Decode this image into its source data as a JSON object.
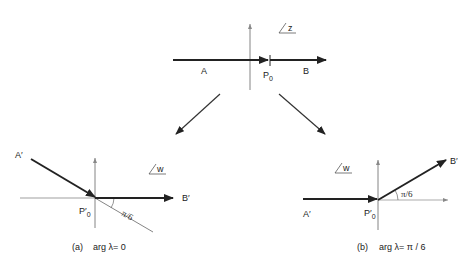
{
  "top_panel": {
    "plane_label": "z",
    "point_a": "A",
    "point_b": "B",
    "point_p": "P",
    "point_p_sub": "0"
  },
  "panel_a": {
    "plane_label": "w",
    "point_a": "A′",
    "point_b": "B′",
    "point_p": "P′",
    "point_p_sub": "0",
    "angle_label": "π/6",
    "caption_tag": "(a)",
    "caption_text": "arg λ= 0"
  },
  "panel_b": {
    "plane_label": "w",
    "point_a": "A′",
    "point_b": "B′",
    "point_p": "P′",
    "point_p_sub": "0",
    "angle_label": "π/6",
    "caption_tag": "(b)",
    "caption_text": "arg λ= π / 6"
  },
  "colors": {
    "line": "#222222",
    "axis": "#555555"
  }
}
